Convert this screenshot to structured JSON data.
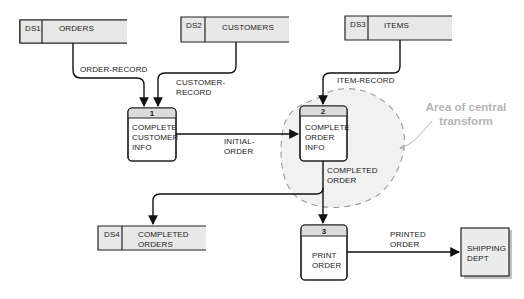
{
  "diagram": {
    "type": "data-flow-diagram",
    "colors": {
      "store_fill": "#e8e8e8",
      "process_header_fill": "#dcdcdc",
      "process_body_fill": "#ffffff",
      "entity_fill": "#ececec",
      "line": "#111111",
      "annotation": "#b5b5b5",
      "central_area_fill": "#f1f1f1",
      "central_area_stroke": "#9a9a9a"
    },
    "data_stores": [
      {
        "id": "DS1",
        "name": "ORDERS"
      },
      {
        "id": "DS2",
        "name": "CUSTOMERS"
      },
      {
        "id": "DS3",
        "name": "ITEMS"
      },
      {
        "id": "DS4",
        "name_line1": "COMPLETED",
        "name_line2": "ORDERS"
      }
    ],
    "processes": [
      {
        "number": "1",
        "line1": "COMPLETE",
        "line2": "CUSTOMER",
        "line3": "INFO"
      },
      {
        "number": "2",
        "line1": "COMPLETE",
        "line2": "ORDER",
        "line3": "INFO"
      },
      {
        "number": "3",
        "line1": "PRINT",
        "line2": "ORDER"
      }
    ],
    "external_entities": [
      {
        "line1": "SHIPPING",
        "line2": "DEPT"
      }
    ],
    "flows": [
      {
        "label": "ORDER-RECORD",
        "from": "DS1",
        "to": "1"
      },
      {
        "label_line1": "CUSTOMER-",
        "label_line2": "RECORD",
        "from": "DS2",
        "to": "1"
      },
      {
        "label": "ITEM-RECORD",
        "from": "DS3",
        "to": "2"
      },
      {
        "label_line1": "INITIAL-",
        "label_line2": "ORDER",
        "from": "1",
        "to": "2"
      },
      {
        "label_line1": "COMPLETED",
        "label_line2": "ORDER",
        "from": "2",
        "to": "DS4 and 3"
      },
      {
        "label_line1": "PRINTED",
        "label_line2": "ORDER",
        "from": "3",
        "to": "SHIPPING DEPT"
      }
    ],
    "annotation": {
      "line1": "Area of central",
      "line2": "transform"
    }
  }
}
